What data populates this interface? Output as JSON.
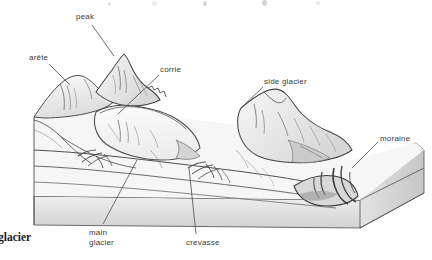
{
  "figure": {
    "background_color": "#ffffff",
    "ink_color": "#4a4a4a",
    "label_color": "#3a3a3a",
    "fill_light": "#f2f2f2",
    "fill_mid": "#e4e4e4",
    "fill_shadow": "#cfcfcf"
  },
  "labels": {
    "peak": "peak",
    "arete": "arête",
    "corrie": "corrie",
    "side_glacier": "side glacier",
    "moraine": "moraine",
    "main_glacier_line1": "main",
    "main_glacier_line2": "glacier",
    "crevasse": "crevasse",
    "caption_bold": "glacier"
  },
  "label_positions": {
    "peak": {
      "x": 76,
      "y": 12
    },
    "arete": {
      "x": 29,
      "y": 53
    },
    "corrie": {
      "x": 160,
      "y": 65
    },
    "side_glacier": {
      "x": 264,
      "y": 77
    },
    "moraine": {
      "x": 380,
      "y": 134
    },
    "main_glacier": {
      "x": 89,
      "y": 228
    },
    "crevasse": {
      "x": 186,
      "y": 238
    },
    "caption_bold": {
      "x": 0,
      "y": 231
    }
  },
  "leader_lines": [
    {
      "name": "peak-leader",
      "from": [
        92,
        25
      ],
      "to": [
        114,
        56
      ]
    },
    {
      "name": "arete-leader",
      "from": [
        49,
        64
      ],
      "to": [
        70,
        85
      ]
    },
    {
      "name": "corrie-leader",
      "from": [
        159,
        75
      ],
      "to": [
        118,
        114
      ]
    },
    {
      "name": "side-glacier-leader",
      "from": [
        263,
        87
      ],
      "to": [
        241,
        108
      ]
    },
    {
      "name": "moraine-leader",
      "from": [
        378,
        142
      ],
      "to": [
        352,
        168
      ]
    },
    {
      "name": "main-glacier-leader",
      "from": [
        103,
        224
      ],
      "to": [
        137,
        160
      ]
    },
    {
      "name": "crevasse-leader",
      "from": [
        196,
        234
      ],
      "to": [
        189,
        168
      ]
    }
  ]
}
